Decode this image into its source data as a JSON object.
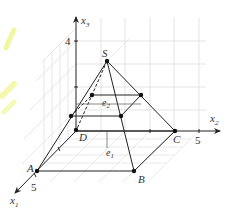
{
  "figure": {
    "type": "3d-pyramid-coordinate-diagram",
    "axes": {
      "x1": {
        "label": "x",
        "subscript": "1",
        "tick": "5"
      },
      "x2": {
        "label": "x",
        "subscript": "2",
        "tick": "5"
      },
      "x3": {
        "label": "x",
        "subscript": "3",
        "tick": "4"
      }
    },
    "vertices": {
      "A": "A",
      "B": "B",
      "C": "C",
      "D": "D",
      "S": "S"
    },
    "planes": {
      "e1": {
        "label": "e",
        "subscript": "1"
      },
      "e2": {
        "label": "e",
        "subscript": "2"
      }
    },
    "colors": {
      "line": "#222222",
      "grid": "#d8d8d8",
      "highlight": "#e8f27a"
    }
  }
}
